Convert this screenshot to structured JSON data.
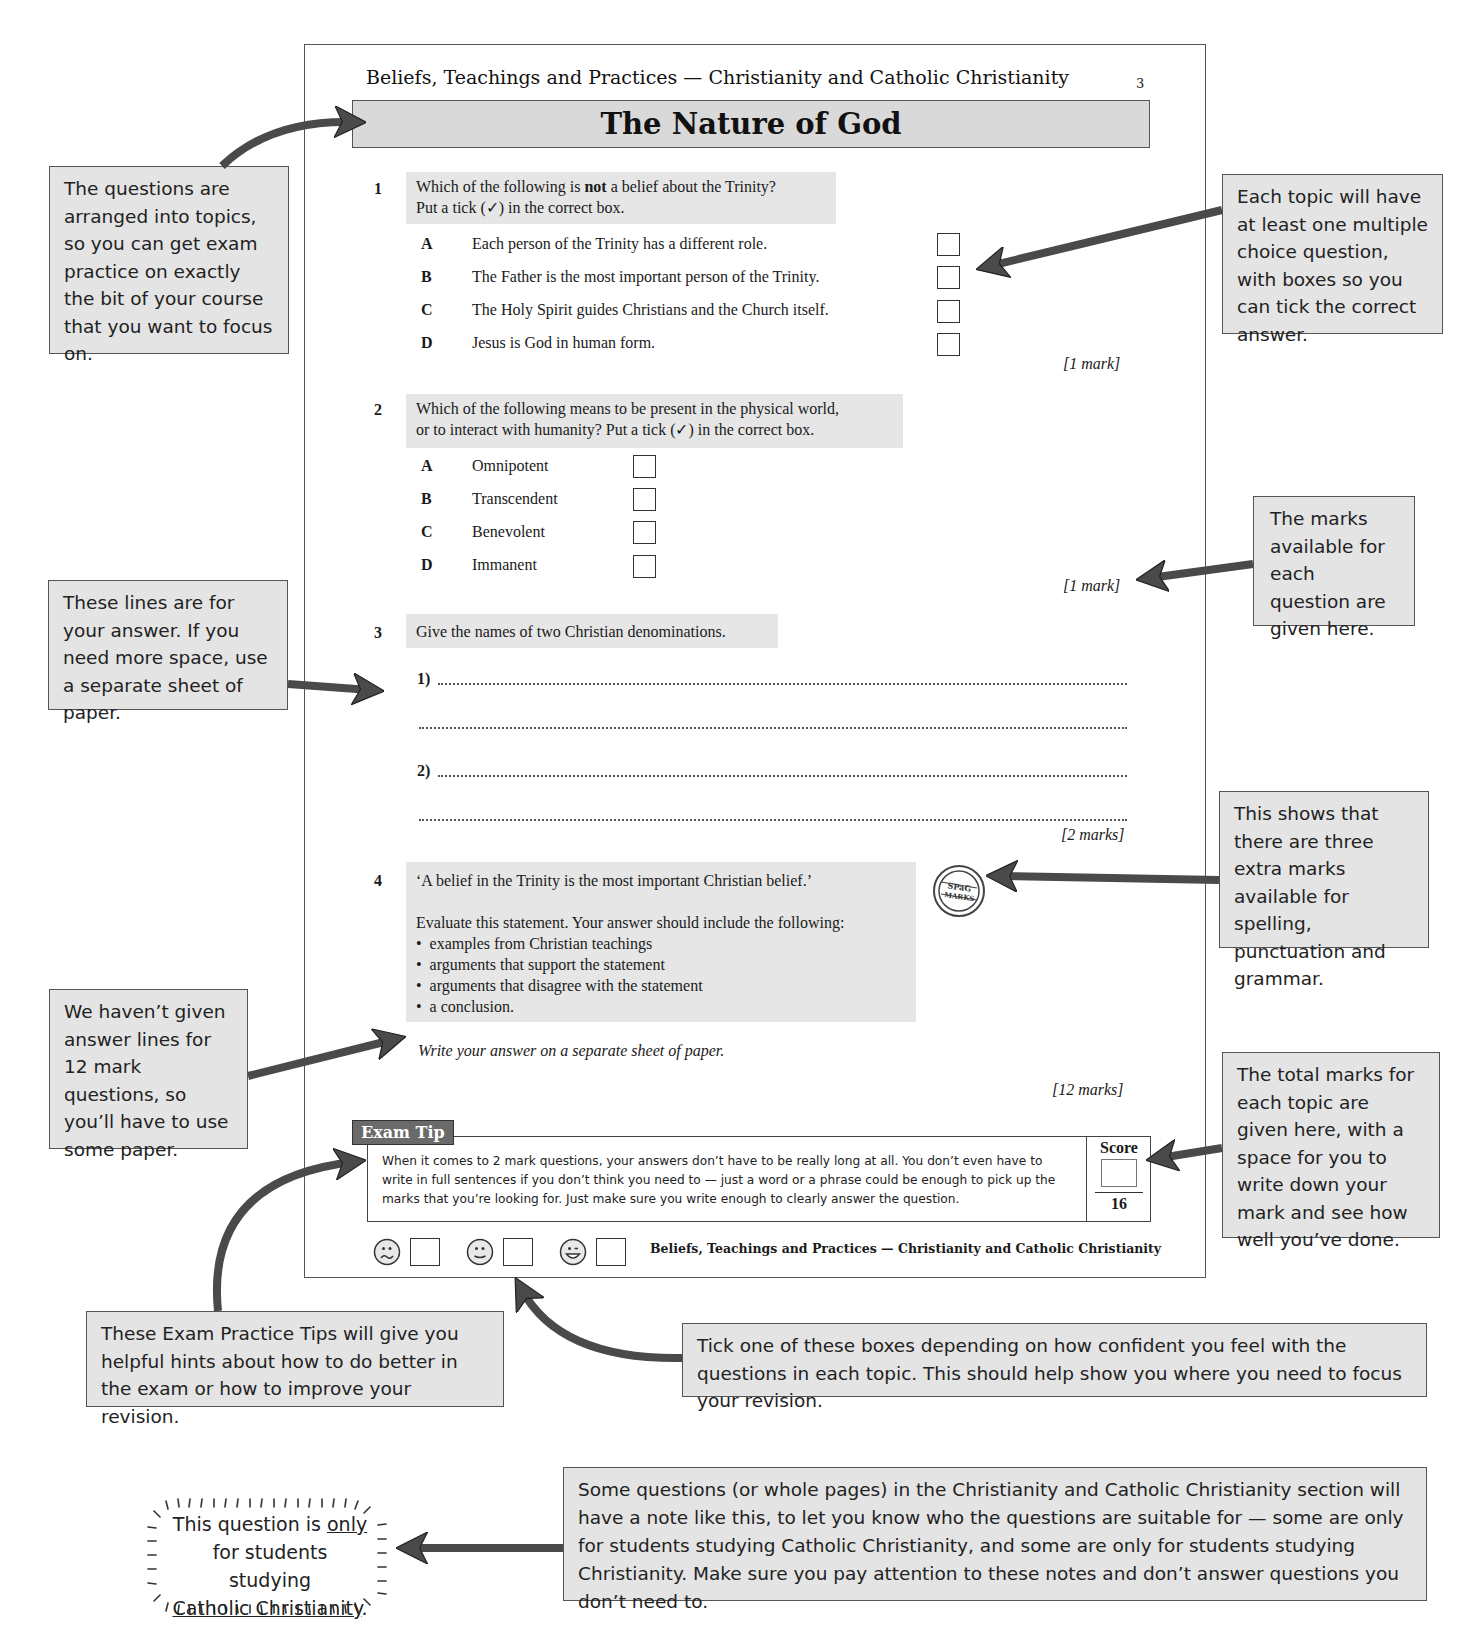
{
  "page": {
    "running_head": "Beliefs, Teachings and Practices — Christianity and Catholic Christianity",
    "page_number": "3",
    "title": "The Nature of God",
    "footer_text": "Beliefs, Teachings and Practices — Christianity and Catholic Christianity"
  },
  "questions": [
    {
      "number": "1",
      "prompt_line1_pre": "Which of the following is ",
      "prompt_line1_bold": "not",
      "prompt_line1_post": " a belief about the Trinity?",
      "prompt_line2": "Put a tick (✓) in the correct box.",
      "options": [
        {
          "letter": "A",
          "text": "Each person of the Trinity has a different role."
        },
        {
          "letter": "B",
          "text": "The Father is the most important person of the Trinity."
        },
        {
          "letter": "C",
          "text": "The Holy Spirit guides Christians and the Church itself."
        },
        {
          "letter": "D",
          "text": "Jesus is God in human form."
        }
      ],
      "marks": "[1 mark]"
    },
    {
      "number": "2",
      "prompt_line1": "Which of the following means to be present in the physical world,",
      "prompt_line2": "or to interact with humanity?  Put a tick (✓) in the correct box.",
      "options": [
        {
          "letter": "A",
          "text": "Omnipotent"
        },
        {
          "letter": "B",
          "text": "Transcendent"
        },
        {
          "letter": "C",
          "text": "Benevolent"
        },
        {
          "letter": "D",
          "text": "Immanent"
        }
      ],
      "marks": "[1 mark]"
    },
    {
      "number": "3",
      "prompt": "Give the names of two Christian denominations.",
      "answer_labels": [
        "1)",
        "2)"
      ],
      "marks": "[2 marks]"
    },
    {
      "number": "4",
      "quote": "‘A belief in the Trinity is the most important Christian belief.’",
      "instruction": "Evaluate this statement.  Your answer should include the following:",
      "bullets": [
        "examples from Christian teachings",
        "arguments that support the statement",
        "arguments that disagree with the statement",
        "a conclusion."
      ],
      "answer_note": "Write your answer on a separate sheet of paper.",
      "marks": "[12 marks]",
      "spag_badge": [
        "SPaG",
        "MARKS"
      ]
    }
  ],
  "exam_tip": {
    "tab_label": "Exam Tip",
    "text": "When it comes to 2 mark questions, your answers don’t have to be really long at all.  You don’t even have to write in full sentences if you don’t think you need to — just a word or a phrase could be enough to pick up the marks that you’re looking for.  Just make sure you write enough to clearly answer the question."
  },
  "score": {
    "label": "Score",
    "value": "",
    "total": "16"
  },
  "confidence": [
    {
      "icon": "sad-face-icon"
    },
    {
      "icon": "neutral-face-icon"
    },
    {
      "icon": "happy-face-icon"
    }
  ],
  "callouts": {
    "topics": "The questions are arranged into topics, so you can get exam practice on exactly the bit of your course that you want to focus on.",
    "multiple_choice": "Each topic will have at least one multiple choice question, with boxes so you can tick the correct answer.",
    "marks": "The marks available for each question are given here.",
    "answer_lines": "These lines are for your answer.  If you need more space, use a separate sheet of paper.",
    "spag": "This shows that there are three extra marks available for spelling, punctuation and grammar.",
    "no_lines": "We haven’t given answer lines for 12 mark questions, so you’ll have to use some paper.",
    "total_marks": "The total marks for each topic are given here, with a space for you to write down your mark and see how well you’ve done.",
    "exam_tips": "These Exam Practice Tips will give you helpful hints about how to do better in the exam or how to improve your revision.",
    "confidence": "Tick one of these boxes depending on how confident you feel with the questions in each topic.  This should help show you where you need to focus your revision.",
    "notes": "Some questions (or whole pages) in the Christianity and Catholic Christianity section will have a note like this, to let you know who the questions are suitable for — some are only for students studying Catholic Christianity, and some are only for students studying Christianity. Make sure you pay attention to these notes and don’t answer questions you don’t need to."
  },
  "note_bubble": {
    "line1_pre": "This question is ",
    "line1_underlined": "only",
    "line2": "for students studying",
    "line3_underlined": "Catholic Christianity",
    "line3_post": "."
  }
}
